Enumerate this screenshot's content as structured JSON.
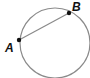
{
  "diagram": {
    "type": "circle-with-chord",
    "points": [
      {
        "id": "A",
        "label": "A"
      },
      {
        "id": "B",
        "label": "B"
      }
    ],
    "segments": [
      {
        "from": "A",
        "to": "B",
        "kind": "chord"
      }
    ],
    "colors": {
      "circle": "#8a8a8a",
      "chord": "#8a8a8a",
      "point": "#111111",
      "label": "#111111"
    }
  }
}
